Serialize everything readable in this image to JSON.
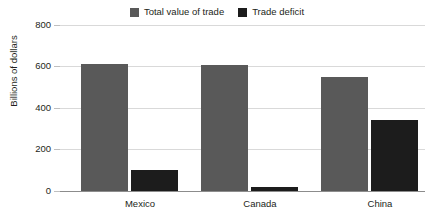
{
  "chart_data": {
    "type": "bar",
    "title": "",
    "subtitle": "",
    "xlabel": "",
    "ylabel": "Billions of dollars",
    "categories": [
      "Mexico",
      "Canada",
      "China"
    ],
    "series": [
      {
        "name": "Total value of trade",
        "color": "#595959",
        "values": [
          613,
          608,
          550
        ]
      },
      {
        "name": "Trade deficit",
        "color": "#1c1c1c",
        "values": [
          100,
          20,
          340
        ]
      }
    ],
    "ylim": [
      0,
      800
    ],
    "yticks": [
      0,
      200,
      400,
      600,
      800
    ],
    "ytick_labels": [
      "0",
      "200",
      "400",
      "600",
      "800"
    ],
    "grid": true,
    "legend_position": "top-center"
  },
  "legend": {
    "items": [
      {
        "label": "Total value of trade",
        "swatch": "legend-swatch-total-value-of-trade"
      },
      {
        "label": "Trade deficit",
        "swatch": "legend-swatch-trade-deficit"
      }
    ]
  },
  "axis": {
    "y_title": "Billions of dollars",
    "y_labels": [
      "800",
      "600",
      "400",
      "200",
      "0"
    ]
  },
  "categories": {
    "items": [
      "Mexico",
      "Canada",
      "China"
    ]
  },
  "colors": {
    "series_total": "#595959",
    "series_deficit": "#1c1c1c",
    "grid": "#d9d9d9",
    "baseline": "#8c8c8c",
    "text": "#231f20",
    "background": "#ffffff"
  }
}
